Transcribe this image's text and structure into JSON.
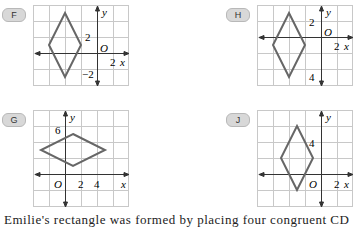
{
  "options": [
    {
      "label": "F",
      "y_label": "y",
      "x_label": "x",
      "origin_label": "O",
      "ticks": [
        "2",
        "2",
        "−2"
      ]
    },
    {
      "label": "H",
      "y_label": "y",
      "x_label": "x",
      "origin_label": "O",
      "ticks": [
        "2",
        "2",
        "4"
      ]
    },
    {
      "label": "G",
      "y_label": "y",
      "x_label": "x",
      "origin_label": "O",
      "ticks": [
        "6",
        "2",
        "4"
      ]
    },
    {
      "label": "J",
      "y_label": "y",
      "x_label": "x",
      "origin_label": "O",
      "ticks": [
        "4",
        "2"
      ]
    }
  ],
  "bottom_text": "Emilie's rectangle was formed by placing four congruent CD",
  "colors": {
    "grid": "#c8c8c8",
    "axis": "#333333",
    "rhombus": "#666666",
    "badge": "#d8d8d8"
  }
}
